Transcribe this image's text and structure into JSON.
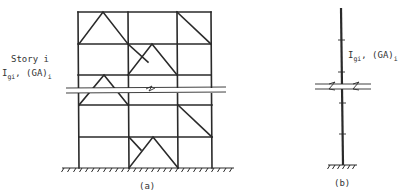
{
  "figure_a": {
    "caption": "(a)",
    "story_label": "Story i",
    "stiffness_label": {
      "I": "I",
      "I_sub": "gi",
      "sep": ", (GA)",
      "GA_sub": "i"
    },
    "bays": 3,
    "stories_shown": 5,
    "bracing": [
      {
        "story": 1,
        "bay": 1,
        "type": "chevron"
      },
      {
        "story": 1,
        "bay": 3,
        "type": "diagonal"
      },
      {
        "story": 2,
        "bay": 2,
        "type": "chevron"
      },
      {
        "story": 2,
        "bay": 3,
        "type": "diagonal"
      },
      {
        "story": 3,
        "bay": 1,
        "type": "chevron"
      },
      {
        "story": 4,
        "bay": 3,
        "type": "diagonal"
      },
      {
        "story": 5,
        "bay": 2,
        "type": "chevron"
      },
      {
        "story": 5,
        "bay": 3,
        "type": "diagonal"
      }
    ]
  },
  "figure_b": {
    "caption": "(b)",
    "stiffness_label": {
      "I": "I",
      "I_sub": "gi",
      "sep": ", (GA)",
      "GA_sub": "i"
    }
  }
}
